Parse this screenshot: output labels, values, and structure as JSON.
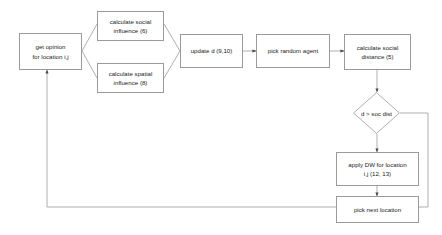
{
  "diagram": {
    "stroke_color": "#9a9a9a",
    "text_color": "#1a1a1a",
    "background": "#ffffff",
    "nodes": [
      {
        "id": "get-opinion",
        "label": "get opinion\nfor location i,j",
        "shape": "rect"
      },
      {
        "id": "calc-social-inf",
        "label": "calculate social\ninfluence (6)",
        "shape": "rect"
      },
      {
        "id": "calc-spatial-inf",
        "label": "calculate spatial\ninfluence (8)",
        "shape": "rect"
      },
      {
        "id": "update-d",
        "label": "update d (9,10)",
        "shape": "rect"
      },
      {
        "id": "pick-random-agent",
        "label": "pick random agent",
        "shape": "rect"
      },
      {
        "id": "calc-social-dist",
        "label": "calculate social\ndistance (5)",
        "shape": "rect"
      },
      {
        "id": "decision-soc-dist",
        "label": "d > soc dist",
        "shape": "diamond"
      },
      {
        "id": "apply-dw",
        "label": "apply DW for location\ni,j (12, 13)",
        "shape": "rect"
      },
      {
        "id": "pick-next-location",
        "label": "pick next location",
        "shape": "rect"
      }
    ]
  }
}
